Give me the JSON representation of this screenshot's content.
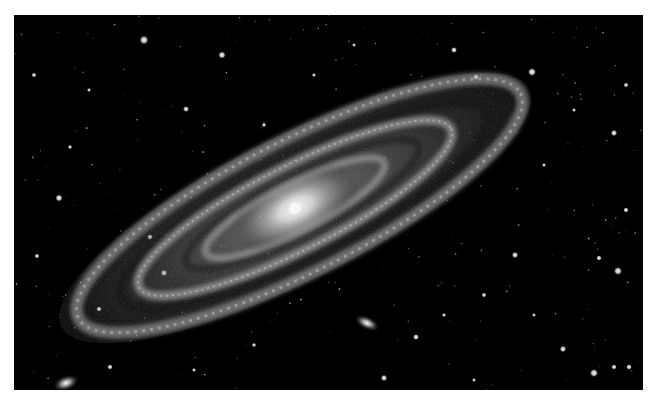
{
  "image": {
    "subject": "Andromeda Galaxy (M31) with satellite galaxy M32",
    "style": "grayscale astrophotography",
    "background_color": "#000000",
    "page_color": "#ffffff"
  },
  "galaxy": {
    "core": {
      "x": 281,
      "y": 193
    },
    "tilt_deg": -27,
    "color": "#ffffff"
  },
  "satellites": [
    {
      "name": "M32",
      "x": 353,
      "y": 308,
      "rx": 14,
      "ry": 7,
      "tilt_deg": 25
    },
    {
      "name": "M110-fragment",
      "x": 52,
      "y": 368,
      "rx": 14,
      "ry": 8,
      "tilt_deg": -20
    }
  ],
  "stars": [
    {
      "x": 130,
      "y": 25,
      "r": 2.2
    },
    {
      "x": 208,
      "y": 40,
      "r": 1.8
    },
    {
      "x": 440,
      "y": 35,
      "r": 1.5
    },
    {
      "x": 518,
      "y": 57,
      "r": 2.0
    },
    {
      "x": 462,
      "y": 62,
      "r": 1.5
    },
    {
      "x": 172,
      "y": 94,
      "r": 1.5
    },
    {
      "x": 45,
      "y": 183,
      "r": 1.8
    },
    {
      "x": 136,
      "y": 222,
      "r": 1.4
    },
    {
      "x": 150,
      "y": 258,
      "r": 1.6
    },
    {
      "x": 600,
      "y": 118,
      "r": 1.6
    },
    {
      "x": 604,
      "y": 256,
      "r": 2.0
    },
    {
      "x": 501,
      "y": 240,
      "r": 1.6
    },
    {
      "x": 585,
      "y": 243,
      "r": 1.3
    },
    {
      "x": 402,
      "y": 322,
      "r": 1.5
    },
    {
      "x": 390,
      "y": 402,
      "r": 1.3
    },
    {
      "x": 580,
      "y": 358,
      "r": 2.0
    },
    {
      "x": 615,
      "y": 352,
      "r": 1.4
    },
    {
      "x": 549,
      "y": 334,
      "r": 1.6
    },
    {
      "x": 96,
      "y": 352,
      "r": 1.3
    },
    {
      "x": 600,
      "y": 352,
      "r": 1.3
    },
    {
      "x": 370,
      "y": 363,
      "r": 1.6
    },
    {
      "x": 85,
      "y": 294,
      "r": 1.3
    },
    {
      "x": 23,
      "y": 241,
      "r": 1.2
    },
    {
      "x": 612,
      "y": 195,
      "r": 1.3
    },
    {
      "x": 56,
      "y": 132,
      "r": 1.1
    },
    {
      "x": 300,
      "y": 60,
      "r": 1.0
    },
    {
      "x": 250,
      "y": 110,
      "r": 1.1
    },
    {
      "x": 75,
      "y": 75,
      "r": 1.0
    },
    {
      "x": 530,
      "y": 150,
      "r": 1.0
    },
    {
      "x": 470,
      "y": 280,
      "r": 1.2
    },
    {
      "x": 430,
      "y": 300,
      "r": 1.0
    },
    {
      "x": 240,
      "y": 330,
      "r": 1.1
    },
    {
      "x": 180,
      "y": 355,
      "r": 1.0
    },
    {
      "x": 612,
      "y": 70,
      "r": 1.2
    },
    {
      "x": 560,
      "y": 95,
      "r": 1.0
    },
    {
      "x": 340,
      "y": 30,
      "r": 1.0
    },
    {
      "x": 20,
      "y": 60,
      "r": 1.2
    },
    {
      "x": 460,
      "y": 365,
      "r": 1.0
    },
    {
      "x": 520,
      "y": 300,
      "r": 1.0
    }
  ]
}
